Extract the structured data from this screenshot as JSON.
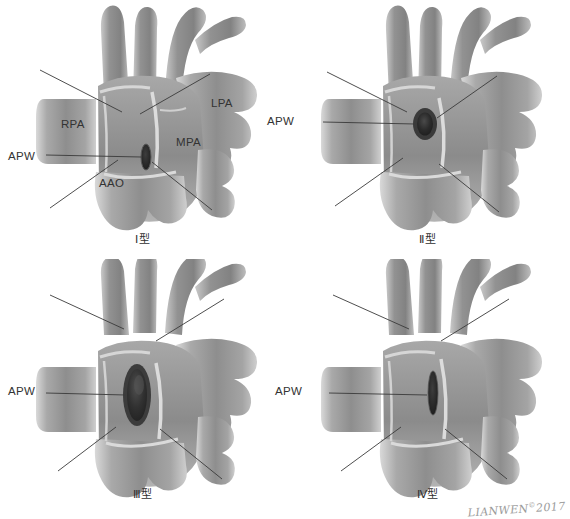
{
  "figure": {
    "watermark_text": "LIANWEN",
    "watermark_mark": "©",
    "watermark_year": "2017"
  },
  "palette": {
    "vessel_light": "#b5b5b5",
    "vessel_mid": "#969696",
    "vessel_dark": "#7a7a7a",
    "vessel_shadow": "#636363",
    "defect_dark": "#2a2a2a",
    "defect_rim": "#4a4a4a",
    "leader_line": "#3a3a3a",
    "text": "#333333",
    "background": "#ffffff"
  },
  "panels": [
    {
      "id": "type-1",
      "caption": "Ⅰ型",
      "defect_shape": "small-oval-slit",
      "labels": [
        {
          "name": "apw",
          "text": "APW",
          "x": 8,
          "y": 150
        },
        {
          "name": "rpa",
          "text": "RPA",
          "x": 61,
          "y": 118
        },
        {
          "name": "lpa",
          "text": "LPA",
          "x": 211,
          "y": 97
        },
        {
          "name": "mpa",
          "text": "MPA",
          "x": 176,
          "y": 136
        },
        {
          "name": "aao",
          "text": "AAO",
          "x": 99,
          "y": 177
        }
      ]
    },
    {
      "id": "type-2",
      "caption": "Ⅱ型",
      "defect_shape": "round-ring",
      "labels": [
        {
          "name": "apw",
          "text": "APW",
          "x": 267,
          "y": 115
        }
      ]
    },
    {
      "id": "type-3",
      "caption": "Ⅲ型",
      "defect_shape": "large-elongated-oval",
      "labels": [
        {
          "name": "apw",
          "text": "APW",
          "x": 8,
          "y": 385
        }
      ]
    },
    {
      "id": "type-4",
      "caption": "Ⅳ型",
      "defect_shape": "narrow-vertical-slit",
      "labels": [
        {
          "name": "apw",
          "text": "APW",
          "x": 275,
          "y": 385
        }
      ]
    }
  ],
  "legend_terms": {
    "APW": "aortopulmonary window",
    "RPA": "right pulmonary artery",
    "LPA": "left pulmonary artery",
    "MPA": "main pulmonary artery",
    "AAO": "ascending aorta"
  }
}
